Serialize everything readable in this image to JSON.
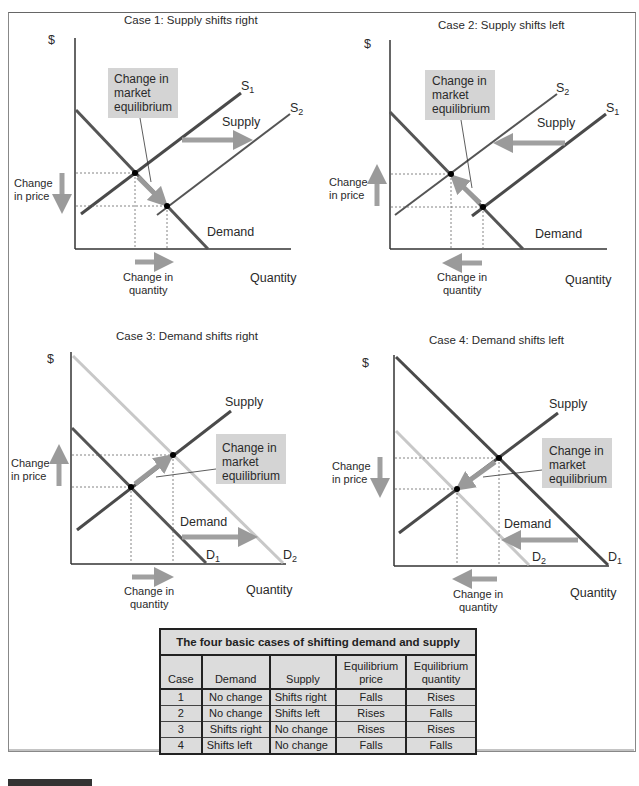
{
  "panels": [
    {
      "id": "case1",
      "title": "Case 1: Supply shifts right",
      "y_axis_label": "$",
      "x_axis_label": "Quantity",
      "curve_labels": {
        "old_supply": "S",
        "old_supply_sub": "1",
        "new_supply": "S",
        "new_supply_sub": "2",
        "shift_label": "Supply",
        "demand": "Demand"
      },
      "callout": [
        "Change in",
        "market",
        "equilibrium"
      ],
      "price_change_label": [
        "Change",
        "in price"
      ],
      "price_change_direction": "down",
      "quantity_change_label": [
        "Change in",
        "quantity"
      ],
      "quantity_change_direction": "right"
    },
    {
      "id": "case2",
      "title": "Case 2: Supply shifts left",
      "y_axis_label": "$",
      "x_axis_label": "Quantity",
      "curve_labels": {
        "new_supply": "S",
        "new_supply_sub": "2",
        "old_supply": "S",
        "old_supply_sub": "1",
        "shift_label": "Supply",
        "demand": "Demand"
      },
      "callout": [
        "Change in",
        "market",
        "equilibrium"
      ],
      "price_change_label": [
        "Change",
        "in price"
      ],
      "price_change_direction": "up",
      "quantity_change_label": [
        "Change in",
        "quantity"
      ],
      "quantity_change_direction": "left"
    },
    {
      "id": "case3",
      "title": "Case 3: Demand shifts right",
      "y_axis_label": "$",
      "x_axis_label": "Quantity",
      "curve_labels": {
        "supply": "Supply",
        "shift_label": "Demand",
        "old_demand": "D",
        "old_demand_sub": "1",
        "new_demand": "D",
        "new_demand_sub": "2"
      },
      "callout": [
        "Change in",
        "market",
        "equilibrium"
      ],
      "price_change_label": [
        "Change",
        "in price"
      ],
      "price_change_direction": "up",
      "quantity_change_label": [
        "Change in",
        "quantity"
      ],
      "quantity_change_direction": "right"
    },
    {
      "id": "case4",
      "title": "Case 4: Demand shifts left",
      "y_axis_label": "$",
      "x_axis_label": "Quantity",
      "curve_labels": {
        "supply": "Supply",
        "shift_label": "Demand",
        "new_demand": "D",
        "new_demand_sub": "2",
        "old_demand": "D",
        "old_demand_sub": "1"
      },
      "callout": [
        "Change in",
        "market",
        "equilibrium"
      ],
      "price_change_label": [
        "Change",
        "in price"
      ],
      "price_change_direction": "down",
      "quantity_change_label": [
        "Change in",
        "quantity"
      ],
      "quantity_change_direction": "left"
    }
  ],
  "table": {
    "caption": "The four basic cases of shifting demand and supply",
    "headers": [
      "Case",
      "Demand",
      "Supply",
      "Equilibrium price",
      "Equilibrium quantity"
    ],
    "header_lines": [
      [
        "Case"
      ],
      [
        "Demand"
      ],
      [
        "Supply"
      ],
      [
        "Equilibrium",
        "price"
      ],
      [
        "Equilibrium",
        "quantity"
      ]
    ],
    "rows": [
      [
        "1",
        "No change",
        "Shifts right",
        "Falls",
        "Rises"
      ],
      [
        "2",
        "No change",
        "Shifts left",
        "Rises",
        "Falls"
      ],
      [
        "3",
        "Shifts right",
        "No change",
        "Rises",
        "Rises"
      ],
      [
        "4",
        "Shifts left",
        "No change",
        "Falls",
        "Falls"
      ]
    ]
  },
  "colors": {
    "curve_dark": "#4a4a4a",
    "curve_light": "#c8c8c8",
    "arrow_fill": "#a8a8a8",
    "callout_box": "#d4d4d4",
    "table_bg": "#dcdcdc"
  }
}
